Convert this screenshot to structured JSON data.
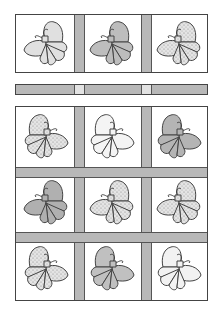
{
  "quilt": {
    "title": "Butterfly Quilt Layout",
    "colors": {
      "sashing": "#b8b8b8",
      "outline": "#444444",
      "light": "#e6e6e6",
      "mid": "#bdbdbd",
      "dark": "#a6a6a6",
      "background": "#ffffff"
    },
    "top_row": [
      {
        "fill": "light",
        "orientation": "left"
      },
      {
        "fill": "mid",
        "orientation": "left"
      },
      {
        "fill": "dotted",
        "orientation": "left"
      }
    ],
    "separator_strip": {
      "posts": 2
    },
    "grid": [
      [
        {
          "fill": "dotted",
          "orientation": "right"
        },
        {
          "fill": "white",
          "orientation": "right"
        },
        {
          "fill": "mid",
          "orientation": "right"
        }
      ],
      [
        {
          "fill": "mid",
          "orientation": "left"
        },
        {
          "fill": "dotted",
          "orientation": "left"
        },
        {
          "fill": "dotted",
          "orientation": "left"
        }
      ],
      [
        {
          "fill": "dotted",
          "orientation": "right"
        },
        {
          "fill": "mid",
          "orientation": "right"
        },
        {
          "fill": "white",
          "orientation": "right"
        }
      ]
    ]
  }
}
